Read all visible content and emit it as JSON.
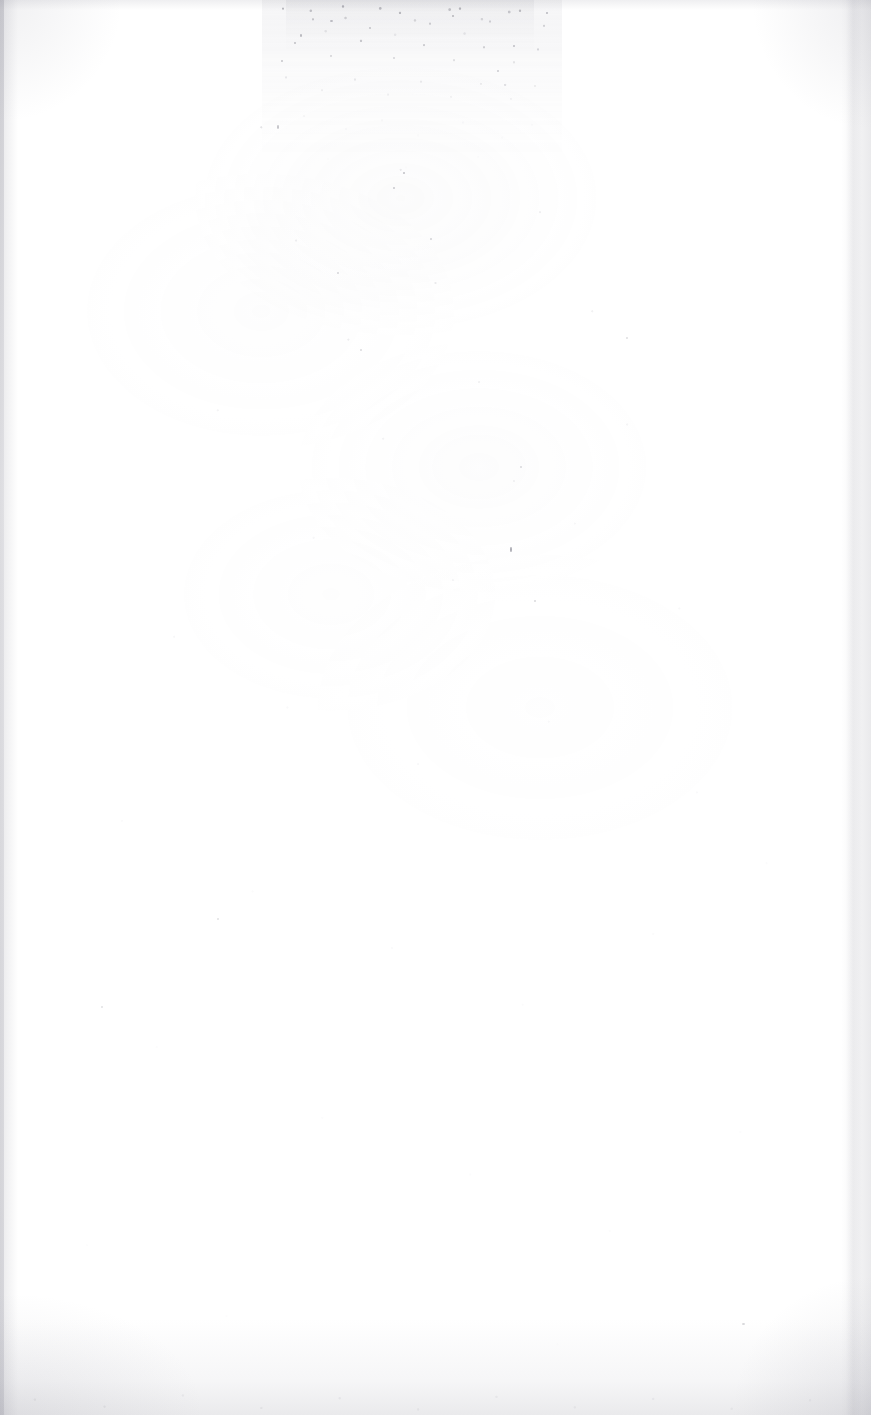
{
  "page": {
    "kind": "scanned-page",
    "content_state": "blank",
    "width": 871,
    "height": 1415,
    "text_content": "",
    "paper_color": "#ffffff",
    "ink_color": "#6c6c78"
  },
  "artifacts": {
    "top_stain": {
      "name": "top-edge-speckle-stain",
      "left": 262,
      "top": 0,
      "width": 300,
      "height": 215,
      "color": "#8a8a96"
    },
    "bottom_band": {
      "name": "bottom-edge-gray-band",
      "height": 96,
      "color": "#9696a0"
    },
    "left_edge": {
      "name": "left-edge-shadow",
      "width": 18,
      "color": "#96969f"
    },
    "right_edge": {
      "name": "right-edge-shadow",
      "width": 30,
      "color": "#96969f"
    },
    "specks": [
      {
        "x": 510,
        "y": 547,
        "w": 2,
        "h": 5,
        "opacity": 0.55
      },
      {
        "x": 403,
        "y": 172,
        "w": 2,
        "h": 2,
        "opacity": 0.4
      },
      {
        "x": 393,
        "y": 187,
        "w": 2,
        "h": 2,
        "opacity": 0.35
      },
      {
        "x": 277,
        "y": 125,
        "w": 2,
        "h": 4,
        "opacity": 0.38
      },
      {
        "x": 452,
        "y": 15,
        "w": 2,
        "h": 2,
        "opacity": 0.45
      },
      {
        "x": 300,
        "y": 34,
        "w": 2,
        "h": 3,
        "opacity": 0.42
      },
      {
        "x": 513,
        "y": 45,
        "w": 2,
        "h": 2,
        "opacity": 0.4
      },
      {
        "x": 546,
        "y": 12,
        "w": 2,
        "h": 2,
        "opacity": 0.44
      },
      {
        "x": 330,
        "y": 20,
        "w": 3,
        "h": 2,
        "opacity": 0.4
      },
      {
        "x": 281,
        "y": 60,
        "w": 2,
        "h": 2,
        "opacity": 0.36
      },
      {
        "x": 497,
        "y": 70,
        "w": 2,
        "h": 2,
        "opacity": 0.33
      },
      {
        "x": 534,
        "y": 600,
        "w": 2,
        "h": 2,
        "opacity": 0.25
      },
      {
        "x": 430,
        "y": 238,
        "w": 2,
        "h": 2,
        "opacity": 0.28
      },
      {
        "x": 337,
        "y": 272,
        "w": 2,
        "h": 2,
        "opacity": 0.26
      },
      {
        "x": 520,
        "y": 466,
        "w": 2,
        "h": 2,
        "opacity": 0.24
      },
      {
        "x": 360,
        "y": 349,
        "w": 2,
        "h": 2,
        "opacity": 0.24
      },
      {
        "x": 626,
        "y": 337,
        "w": 2,
        "h": 2,
        "opacity": 0.22
      },
      {
        "x": 742,
        "y": 1323,
        "w": 3,
        "h": 2,
        "opacity": 0.26
      },
      {
        "x": 101,
        "y": 1006,
        "w": 2,
        "h": 2,
        "opacity": 0.2
      },
      {
        "x": 217,
        "y": 918,
        "w": 2,
        "h": 2,
        "opacity": 0.2
      }
    ]
  }
}
